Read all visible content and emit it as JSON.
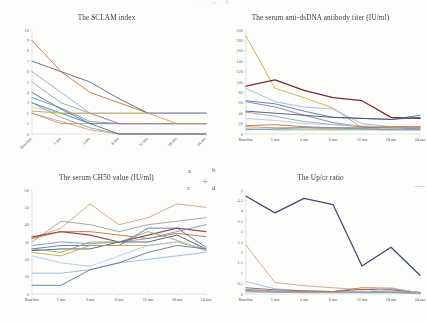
{
  "document": {
    "cropped_header_text": "· · o ,4",
    "panel_labels": [
      "a",
      "b",
      "c",
      "d"
    ],
    "crosshair_glyph": "+"
  },
  "axis": {
    "categories": [
      "Baseline",
      "1 mo",
      "3 mo",
      "6 mo",
      "12 mo",
      "18 mo",
      "24 mo"
    ]
  },
  "colors": {
    "s1": "#4472a8",
    "s2": "#bf6a2e",
    "s3": "#9a9a9a",
    "s4": "#c8a13a",
    "s5": "#6b8fc4",
    "s6": "#7fa86b",
    "s7": "#3f4a6b",
    "s8": "#9b4b4b",
    "s9": "#a8c7e8",
    "s10": "#d9b08c",
    "s11": "#8fb7d4",
    "s12": "#b8907f",
    "s13": "#5b6b8c",
    "s14": "#c9a27a",
    "s15": "#7a9ab8",
    "dark_maroon": "#7d2b2b",
    "navy": "#3c4a6e",
    "axis": "#c9c9cc",
    "text": "#3a3a3a"
  },
  "charts": [
    {
      "id": "sledai",
      "panel": "a",
      "chart_data": {
        "type": "line",
        "title": "The SCLAM index",
        "xlabel": "",
        "ylabel": "",
        "ylim": [
          0,
          10
        ],
        "yticks": [
          0,
          1,
          2,
          3,
          4,
          5,
          6,
          7,
          8,
          9,
          10
        ],
        "grid": false,
        "legend": "none",
        "x": [
          "Baseline",
          "1 mo",
          "3 mo",
          "6 mo",
          "12 mo",
          "18 mo",
          "24 mo"
        ],
        "series": [
          {
            "name": "pt1",
            "color": "#bf6a2e",
            "values": [
              9,
              6,
              4,
              3,
              2,
              2,
              2
            ]
          },
          {
            "name": "pt2",
            "color": "#5b5b75",
            "values": [
              7,
              6,
              5,
              3.4,
              2,
              2,
              2
            ]
          },
          {
            "name": "pt3",
            "color": "#8fa8c4",
            "values": [
              6,
              4,
              2,
              1,
              1,
              1,
              1
            ]
          },
          {
            "name": "pt4",
            "color": "#9a9a9a",
            "values": [
              5,
              3,
              2,
              1,
              1,
              1,
              1
            ]
          },
          {
            "name": "pt5",
            "color": "#6b8fc4",
            "values": [
              3.5,
              2.5,
              1.2,
              1,
              1,
              1,
              1
            ]
          },
          {
            "name": "pt6",
            "color": "#4472a8",
            "values": [
              3,
              2,
              1,
              1,
              1,
              1,
              1
            ]
          },
          {
            "name": "pt7",
            "color": "#7fa86b",
            "values": [
              3,
              1.6,
              0.6,
              0,
              0,
              0,
              0
            ]
          },
          {
            "name": "pt8",
            "color": "#a8c7e8",
            "values": [
              2.6,
              2,
              2,
              2,
              2,
              2,
              2
            ]
          },
          {
            "name": "pt9",
            "color": "#c8a13a",
            "values": [
              2.2,
              2,
              2,
              2,
              2,
              1,
              1
            ]
          },
          {
            "name": "pt10",
            "color": "#d98c8c",
            "values": [
              2,
              1.2,
              0.4,
              0,
              0,
              0,
              0
            ]
          },
          {
            "name": "pt11",
            "color": "#b8907f",
            "values": [
              2,
              1,
              1,
              1,
              1,
              1,
              1
            ]
          },
          {
            "name": "pt12",
            "color": "#3f6b8c",
            "values": [
              4,
              2.4,
              1,
              0,
              0,
              0,
              0
            ]
          }
        ]
      }
    },
    {
      "id": "dsdna",
      "panel": "b",
      "chart_data": {
        "type": "line",
        "title": "The serum anti-dsDNA antibody titer (IU/ml)",
        "xlabel": "",
        "ylabel": "",
        "ylim": [
          0,
          200
        ],
        "yticks": [
          0,
          20,
          40,
          60,
          80,
          100,
          120,
          140,
          160,
          180,
          200
        ],
        "grid": false,
        "legend": "none",
        "x": [
          "Baseline",
          "1 mo",
          "3 mo",
          "6 mo",
          "12 mo",
          "18 mo",
          "24 mo"
        ],
        "series": [
          {
            "name": "pt1",
            "color": "#c8a13a",
            "values": [
              188,
              88,
              70,
              50,
              12,
              12,
              12
            ]
          },
          {
            "name": "pt2",
            "color": "#7d2b2b",
            "values": [
              92,
              104,
              84,
              70,
              64,
              32,
              30
            ],
            "thick": true
          },
          {
            "name": "pt3",
            "color": "#8fb7d4",
            "values": [
              88,
              62,
              52,
              48,
              20,
              14,
              12
            ]
          },
          {
            "name": "pt4",
            "color": "#4472a8",
            "values": [
              64,
              58,
              44,
              32,
              30,
              28,
              36
            ]
          },
          {
            "name": "pt5",
            "color": "#7a7a9a",
            "values": [
              62,
              52,
              36,
              22,
              14,
              12,
              10
            ]
          },
          {
            "name": "pt6",
            "color": "#3f4a6b",
            "values": [
              44,
              40,
              36,
              32,
              30,
              28,
              32
            ]
          },
          {
            "name": "pt7",
            "color": "#9a9a9a",
            "values": [
              42,
              34,
              24,
              18,
              14,
              12,
              14
            ]
          },
          {
            "name": "pt8",
            "color": "#a8c7e8",
            "values": [
              30,
              26,
              20,
              18,
              16,
              14,
              12
            ]
          },
          {
            "name": "pt9",
            "color": "#bf6a2e",
            "values": [
              16,
              18,
              14,
              12,
              12,
              14,
              14
            ]
          },
          {
            "name": "pt10",
            "color": "#b8907f",
            "values": [
              14,
              12,
              12,
              10,
              10,
              12,
              12
            ]
          },
          {
            "name": "pt11",
            "color": "#7fa86b",
            "values": [
              10,
              8,
              8,
              8,
              8,
              8,
              8
            ]
          },
          {
            "name": "pt12",
            "color": "#6b8fc4",
            "values": [
              8,
              10,
              12,
              12,
              10,
              8,
              8
            ]
          }
        ]
      }
    },
    {
      "id": "ch50",
      "panel": "c",
      "chart_data": {
        "type": "line",
        "title": "The serum CH50 value (IU/ml)",
        "xlabel": "",
        "ylabel": "",
        "ylim": [
          0,
          60
        ],
        "yticks": [
          0,
          10,
          20,
          30,
          40,
          50,
          60
        ],
        "grid": false,
        "legend": "none",
        "x": [
          "Baseline",
          "1 mo",
          "3 mo",
          "6 mo",
          "12 mo",
          "18 mo",
          "24 mo"
        ],
        "series": [
          {
            "name": "pt1",
            "color": "#c9a27a",
            "values": [
              32,
              38,
              52,
              40,
              44,
              52,
              50
            ]
          },
          {
            "name": "pt2",
            "color": "#9a9a9a",
            "values": [
              30,
              42,
              40,
              36,
              40,
              42,
              44
            ]
          },
          {
            "name": "pt3",
            "color": "#9b4b4b",
            "values": [
              33,
              36,
              34,
              30,
              34,
              38,
              36
            ],
            "thick": true
          },
          {
            "name": "pt4",
            "color": "#bf6a2e",
            "values": [
              32,
              36,
              36,
              34,
              32,
              35,
              33
            ]
          },
          {
            "name": "pt5",
            "color": "#4472a8",
            "values": [
              26,
              28,
              28,
              28,
              38,
              38,
              27
            ]
          },
          {
            "name": "pt6",
            "color": "#6b8fc4",
            "values": [
              28,
              30,
              29,
              30,
              32,
              36,
              40
            ]
          },
          {
            "name": "pt7",
            "color": "#3f4a6b",
            "values": [
              25,
              26,
              26,
              30,
              30,
              34,
              26
            ]
          },
          {
            "name": "pt8",
            "color": "#7fa86b",
            "values": [
              26,
              24,
              30,
              30,
              36,
              31,
              25
            ]
          },
          {
            "name": "pt9",
            "color": "#c8a13a",
            "values": [
              24,
              22,
              28,
              28,
              28,
              30,
              26
            ]
          },
          {
            "name": "pt10",
            "color": "#a8c7e8",
            "values": [
              22,
              18,
              16,
              22,
              28,
              30,
              26
            ]
          },
          {
            "name": "pt11",
            "color": "#8fb7d4",
            "values": [
              12,
              12,
              14,
              18,
              20,
              22,
              24
            ]
          },
          {
            "name": "pt12",
            "color": "#5b6b8c",
            "values": [
              5,
              5,
              14,
              18,
              24,
              28,
              26
            ]
          }
        ]
      }
    },
    {
      "id": "upcr",
      "panel": "d",
      "chart_data": {
        "type": "line",
        "title": "The Up/cr ratio",
        "xlabel": "",
        "ylabel": "",
        "ylim": [
          0,
          5
        ],
        "yticks": [
          0,
          0.5,
          1,
          1.5,
          2,
          2.5,
          3,
          3.5,
          4,
          4.5,
          5
        ],
        "ytick_labels": [
          "0",
          "0.5",
          "1",
          "1.5",
          "2",
          "2.5",
          "3",
          "3.5",
          "4",
          "4.5",
          "5"
        ],
        "grid": false,
        "legend": "none",
        "x": [
          "Baseline",
          "1 mo",
          "3 mo",
          "6 mo",
          "12 mo",
          "18 mo",
          "24 mo"
        ],
        "series": [
          {
            "name": "pt1",
            "color": "#3c4a6e",
            "values": [
              4.7,
              3.9,
              4.6,
              4.3,
              1.35,
              2.25,
              0.9
            ],
            "thick": true
          },
          {
            "name": "pt2",
            "color": "#c9a27a",
            "values": [
              2.35,
              0.55,
              0.4,
              0.3,
              0.2,
              0.25,
              0.05
            ]
          },
          {
            "name": "pt3",
            "color": "#8fb7d4",
            "values": [
              0.6,
              0.25,
              0.15,
              0.12,
              0.1,
              0.15,
              0.05
            ]
          },
          {
            "name": "pt4",
            "color": "#9b4b4b",
            "values": [
              0.3,
              0.2,
              0.15,
              0.12,
              0.22,
              0.2,
              0.08
            ]
          },
          {
            "name": "pt5",
            "color": "#6b8fc4",
            "values": [
              0.22,
              0.15,
              0.12,
              0.1,
              0.1,
              0.1,
              0.05
            ]
          },
          {
            "name": "pt6",
            "color": "#7fa86b",
            "values": [
              0.18,
              0.12,
              0.1,
              0.08,
              0.08,
              0.08,
              0.04
            ]
          },
          {
            "name": "pt7",
            "color": "#bf6a2e",
            "values": [
              0.15,
              0.1,
              0.1,
              0.12,
              0.3,
              0.28,
              0.06
            ]
          },
          {
            "name": "pt8",
            "color": "#a8c7e8",
            "values": [
              0.12,
              0.1,
              0.08,
              0.08,
              0.08,
              0.3,
              0.05
            ]
          },
          {
            "name": "pt9",
            "color": "#9a9a9a",
            "values": [
              0.1,
              0.08,
              0.06,
              0.06,
              0.06,
              0.06,
              0.03
            ]
          }
        ]
      }
    }
  ]
}
